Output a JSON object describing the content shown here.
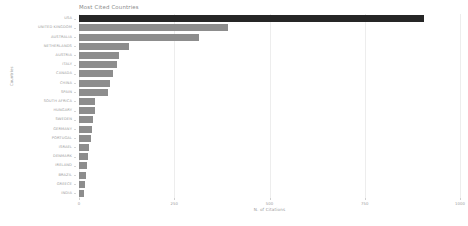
{
  "chart_data": {
    "type": "bar",
    "orientation": "horizontal",
    "title": "Most Cited Countries",
    "xlabel": "N. of Citations",
    "ylabel": "Countries",
    "grid": true,
    "legend": null,
    "xlim": [
      0,
      1000
    ],
    "xticks": [
      0,
      250,
      500,
      750,
      1000
    ],
    "xtick_labels": [
      "0",
      "250",
      "500",
      "750",
      "1000"
    ],
    "categories": [
      "USA",
      "UNITED KINGDOM",
      "AUSTRALIA",
      "NETHERLANDS",
      "AUSTRIA",
      "ITALY",
      "CANADA",
      "CHINA",
      "SPAIN",
      "SOUTH AFRICA",
      "HUNGARY",
      "SWEDEN",
      "GERMANY",
      "PORTUGAL",
      "ISRAEL",
      "DENMARK",
      "IRELAND",
      "BRAZIL",
      "GREECE",
      "INDIA"
    ],
    "values": [
      905,
      390,
      315,
      132,
      105,
      100,
      90,
      81,
      76,
      43,
      41,
      37,
      33,
      31,
      26,
      24,
      22,
      19,
      16,
      13
    ],
    "colors": {
      "bar": "#8d8d8d",
      "highlight_bar": "#262626",
      "gridline": "#ededed",
      "text": "#9a9a9a",
      "background": "#ffffff"
    },
    "highlight_index": 0
  }
}
